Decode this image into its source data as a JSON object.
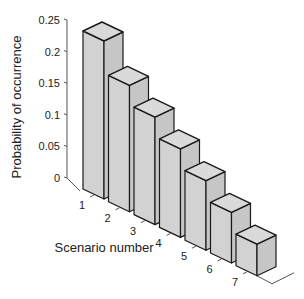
{
  "chart_data": {
    "type": "bar",
    "style": "3d-bar",
    "title": "",
    "xlabel": "Scenario number",
    "ylabel": "Probability of occurrence",
    "categories": [
      "1",
      "2",
      "3",
      "4",
      "5",
      "6",
      "7"
    ],
    "values": [
      0.25,
      0.2,
      0.17,
      0.14,
      0.11,
      0.08,
      0.05
    ],
    "ylim": [
      0,
      0.25
    ],
    "yticks": [
      0,
      0.05,
      0.1,
      0.15,
      0.2,
      0.25
    ],
    "ytick_labels": [
      "0",
      "0.05",
      "0.1",
      "0.15",
      "0.2",
      "0.25"
    ],
    "grid": false,
    "legend": null
  },
  "colors": {
    "bar_front": "#d2d2d2",
    "bar_side": "#c6c6c6",
    "bar_top": "#dadada",
    "edge": "#1a1a1a",
    "axis": "#555555",
    "text": "#222222"
  }
}
